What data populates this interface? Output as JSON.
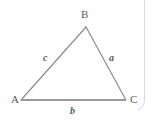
{
  "figure": {
    "name": "triangle-abc-diagram",
    "background_color": "#ffffff",
    "stroke_color": "#8a8a8a",
    "label_color": "#5b5b5b",
    "page_edge_color": "#d8d8d8",
    "vertices": [
      {
        "id": "A",
        "label": "A",
        "x": 21,
        "y": 100
      },
      {
        "id": "B",
        "label": "B",
        "x": 86,
        "y": 27
      },
      {
        "id": "C",
        "label": "C",
        "x": 126,
        "y": 100
      }
    ],
    "sides": [
      {
        "id": "a",
        "label": "a",
        "from": "B",
        "to": "C",
        "italic": true
      },
      {
        "id": "b",
        "label": "b",
        "from": "A",
        "to": "C",
        "italic": true
      },
      {
        "id": "c",
        "label": "c",
        "from": "A",
        "to": "B",
        "italic": true
      }
    ],
    "polygon_points": "21,100 86,27 126,100",
    "base_line": {
      "x1": 21,
      "y1": 100,
      "x2": 126,
      "y2": 100,
      "width": 2.1
    },
    "page_edge": {
      "x": 144.5,
      "y_top": 0,
      "y_bottom": 104,
      "corner_radius": 6
    }
  }
}
